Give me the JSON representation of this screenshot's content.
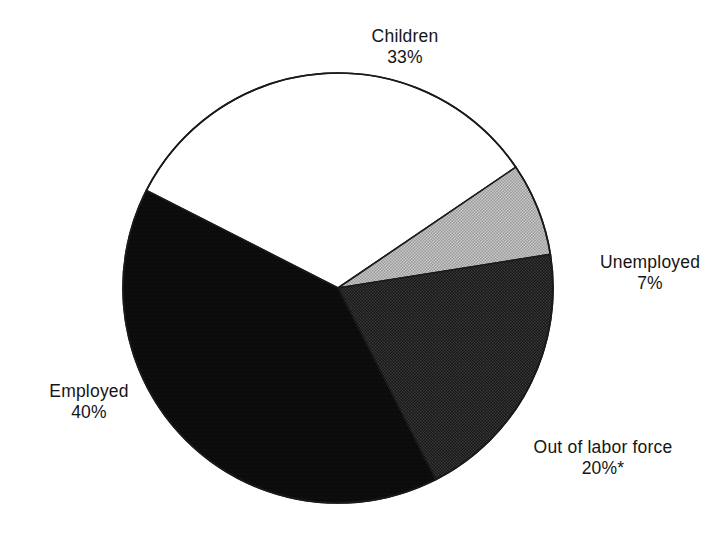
{
  "chart_data": {
    "type": "pie",
    "title": "",
    "subtitle": "",
    "xlabel": "",
    "ylabel": "",
    "legend_position": "none",
    "grid": false,
    "total_percent": 100,
    "footnote_marker": "*",
    "categories": [
      "Children",
      "Unemployed",
      "Out of labor force",
      "Employed"
    ],
    "values": [
      33,
      7,
      20,
      40
    ],
    "slices": [
      {
        "label": "Children",
        "value": 33,
        "value_text": "33%",
        "color": "#ffffff",
        "stroke": "#1a1a1a",
        "fill_style": "solid-white",
        "start_percent": 0,
        "end_percent": 33,
        "label_position": "top"
      },
      {
        "label": "Unemployed",
        "value": 7,
        "value_text": "7%",
        "color": "#b4b4b4",
        "stroke": "#1a1a1a",
        "fill_style": "light-halftone",
        "start_percent": 33,
        "end_percent": 40,
        "label_position": "right"
      },
      {
        "label": "Out of labor force",
        "value": 20,
        "value_text": "20%*",
        "color": "#2b2b2b",
        "stroke": "#1a1a1a",
        "fill_style": "dark-halftone",
        "start_percent": 40,
        "end_percent": 60,
        "label_position": "bottom-right"
      },
      {
        "label": "Employed",
        "value": 40,
        "value_text": "40%",
        "color": "#0d0d0d",
        "stroke": "#1a1a1a",
        "fill_style": "solid-black",
        "start_percent": 60,
        "end_percent": 100,
        "label_position": "left"
      }
    ],
    "geometry": {
      "center_x": 338,
      "center_y": 288,
      "radius": 215,
      "start_angle_deg": -153
    }
  },
  "labels": {
    "children": {
      "name": "Children",
      "value": "33%"
    },
    "unemployed": {
      "name": "Unemployed",
      "value": "7%"
    },
    "outoflabor": {
      "name": "Out of labor force",
      "value": "20%*"
    },
    "employed": {
      "name": "Employed",
      "value": "40%"
    }
  },
  "colors": {
    "background": "#ffffff",
    "outline": "#1a1a1a",
    "text": "#151515",
    "children_fill": "#ffffff",
    "unemployed_fill": "#b4b4b4",
    "outoflabor_fill": "#2b2b2b",
    "employed_fill": "#0d0d0d"
  }
}
